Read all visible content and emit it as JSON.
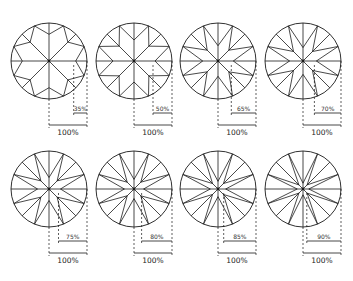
{
  "diagrams": [
    {
      "id": 1,
      "ratio_label": "35%",
      "ratio": 0.35,
      "total_label": "100%",
      "center": [
        49,
        61
      ]
    },
    {
      "id": 2,
      "ratio_label": "50%",
      "ratio": 0.5,
      "total_label": "100%",
      "center": [
        134,
        61
      ]
    },
    {
      "id": 3,
      "ratio_label": "65%",
      "ratio": 0.65,
      "total_label": "100%",
      "center": [
        218,
        61
      ]
    },
    {
      "id": 4,
      "ratio_label": "70%",
      "ratio": 0.7,
      "total_label": "100%",
      "center": [
        303,
        61
      ]
    },
    {
      "id": 5,
      "ratio_label": "75%",
      "ratio": 0.75,
      "total_label": "100%",
      "center": [
        49,
        189
      ]
    },
    {
      "id": 6,
      "ratio_label": "80%",
      "ratio": 0.8,
      "total_label": "100%",
      "center": [
        134,
        189
      ]
    },
    {
      "id": 7,
      "ratio_label": "85%",
      "ratio": 0.85,
      "total_label": "100%",
      "center": [
        218,
        189
      ]
    },
    {
      "id": 8,
      "ratio_label": "90%",
      "ratio": 0.9,
      "total_label": "100%",
      "center": [
        303,
        189
      ]
    }
  ],
  "style": {
    "stroke": "#1a1a1a",
    "radius": 38,
    "points": 8
  }
}
